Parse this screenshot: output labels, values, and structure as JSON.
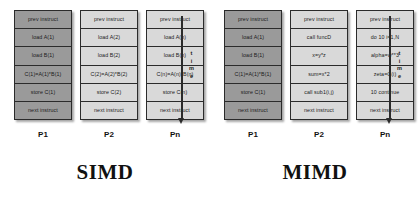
{
  "diagram": {
    "title_simd": "SIMD",
    "title_mimd": "MIMD",
    "time_axis": {
      "label_chars": [
        "t",
        "i",
        "m",
        "e"
      ],
      "direction": "downward"
    },
    "colors": {
      "cell_dark": "#9a9a9a",
      "cell_light": "#d9d9d9",
      "border": "#2b2b2b",
      "text": "#1a1a1a",
      "background": "#ffffff"
    }
  },
  "simd": {
    "title": "SIMD",
    "columns": [
      {
        "label": "P1",
        "shade": "dark",
        "cells": [
          "prev instruct",
          "load A(1)",
          "load B(1)",
          "C(1)=A(1)*B(1)",
          "store C(1)",
          "next instruct"
        ]
      },
      {
        "label": "P2",
        "shade": "light",
        "cells": [
          "prev instruct",
          "load A(2)",
          "load B(2)",
          "C(2)=A(2)*B(2)",
          "store C(2)",
          "next instruct"
        ]
      },
      {
        "label": "Pn",
        "shade": "light",
        "cells": [
          "prev instruct",
          "load A(n)",
          "load B(n)",
          "C(n)=A(n)*B(n)",
          "store C(n)",
          "next instruct"
        ]
      }
    ]
  },
  "mimd": {
    "title": "MIMD",
    "columns": [
      {
        "label": "P1",
        "shade": "dark",
        "cells": [
          "prev instruct",
          "load A(1)",
          "load B(1)",
          "C(1)=A(1)*B(1)",
          "store C(1)",
          "next instruct"
        ]
      },
      {
        "label": "P2",
        "shade": "light",
        "cells": [
          "prev instruct",
          "call funcD",
          "x=y*z",
          "sum=x*2",
          "call sub1(i,j)",
          "next instruct"
        ]
      },
      {
        "label": "Pn",
        "shade": "light",
        "cells": [
          "prev instruct",
          "do 10 i=1,N",
          "alpha=w**3",
          "zeta=C(i)",
          "10 continue",
          "next instruct"
        ]
      }
    ]
  }
}
